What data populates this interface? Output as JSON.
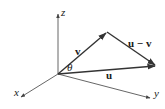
{
  "diagram": {
    "title": "",
    "colors": {
      "line": "#333333",
      "axis": "#555555",
      "background": "#ffffff"
    },
    "origin": [
      58,
      74
    ],
    "axes": [
      {
        "name": "z",
        "label": "z",
        "end": [
          58,
          13
        ],
        "label_pos": [
          61,
          13
        ]
      },
      {
        "name": "x",
        "label": "x",
        "end": [
          20,
          98
        ],
        "label_pos": [
          14,
          94
        ]
      },
      {
        "name": "y",
        "label": "y",
        "end": [
          151,
          99
        ],
        "label_pos": [
          154,
          95
        ]
      }
    ],
    "vectors": [
      {
        "name": "v",
        "label": "v",
        "from": [
          58,
          74
        ],
        "to": [
          107,
          32
        ],
        "label_pos": [
          75,
          55
        ]
      },
      {
        "name": "u",
        "label": "u",
        "from": [
          58,
          74
        ],
        "to": [
          156,
          66
        ],
        "label_pos": [
          106,
          78
        ]
      },
      {
        "name": "u-v",
        "label": "u − v",
        "from": [
          107,
          32
        ],
        "to": [
          156,
          66
        ],
        "label_pos": [
          128,
          47
        ]
      }
    ],
    "angle": {
      "label": "θ",
      "label_pos": [
        67,
        71
      ]
    }
  }
}
